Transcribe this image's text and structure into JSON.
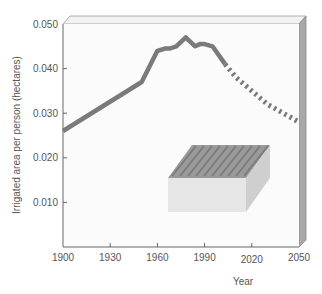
{
  "chart_data": {
    "type": "line",
    "title": "",
    "xlabel": "Year",
    "ylabel": "Irrigated area per person (hectares)",
    "xlim": [
      1900,
      2050
    ],
    "ylim": [
      0,
      0.05
    ],
    "x_ticks": [
      "1900",
      "1930",
      "1960",
      "1990",
      "2020",
      "2050"
    ],
    "y_ticks": [
      "0.010",
      "0.020",
      "0.030",
      "0.040",
      "0.050"
    ],
    "grid": false,
    "legend": "none",
    "series": [
      {
        "name": "Historical",
        "style": "solid",
        "x": [
          1900,
          1950,
          1960,
          1965,
          1968,
          1972,
          1975,
          1978,
          1981,
          1984,
          1987,
          1990,
          1995,
          2003
        ],
        "values": [
          0.026,
          0.037,
          0.044,
          0.0445,
          0.0445,
          0.045,
          0.046,
          0.047,
          0.046,
          0.045,
          0.0455,
          0.0455,
          0.045,
          0.041
        ]
      },
      {
        "name": "Projected",
        "style": "dotted",
        "x": [
          2003,
          2010,
          2020,
          2030,
          2040,
          2050
        ],
        "values": [
          0.041,
          0.038,
          0.035,
          0.032,
          0.03,
          0.028
        ]
      }
    ],
    "annotations": [
      "illustration of irrigated field block"
    ]
  },
  "colors": {
    "line": "#7a7a7a",
    "frame": "#888888",
    "side_panel": "#a8a8a8"
  }
}
